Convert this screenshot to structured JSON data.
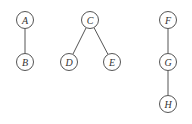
{
  "diagram": {
    "type": "forest",
    "nodes": [
      {
        "id": "A",
        "label": "A",
        "x": 25,
        "y": 20
      },
      {
        "id": "B",
        "label": "B",
        "x": 25,
        "y": 62
      },
      {
        "id": "C",
        "label": "C",
        "x": 90,
        "y": 20
      },
      {
        "id": "D",
        "label": "D",
        "x": 69,
        "y": 62
      },
      {
        "id": "E",
        "label": "E",
        "x": 112,
        "y": 62
      },
      {
        "id": "F",
        "label": "F",
        "x": 168,
        "y": 20
      },
      {
        "id": "G",
        "label": "G",
        "x": 168,
        "y": 62
      },
      {
        "id": "H",
        "label": "H",
        "x": 168,
        "y": 104
      }
    ],
    "edges": [
      [
        "A",
        "B"
      ],
      [
        "C",
        "D"
      ],
      [
        "C",
        "E"
      ],
      [
        "F",
        "G"
      ],
      [
        "G",
        "H"
      ]
    ],
    "colors": {
      "stroke": "#555555",
      "text": "#333333",
      "background": "#ffffff"
    }
  }
}
